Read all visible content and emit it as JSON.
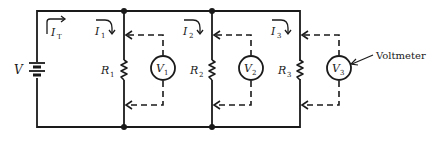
{
  "diagram": {
    "type": "parallel-circuit-with-voltmeters",
    "source": {
      "label": "V"
    },
    "total_current": {
      "label": "I",
      "subscript": "T"
    },
    "branches": [
      {
        "resistor": {
          "label": "R",
          "subscript": "1"
        },
        "current": {
          "label": "I",
          "subscript": "1"
        },
        "voltmeter": {
          "label": "V",
          "subscript": "1"
        }
      },
      {
        "resistor": {
          "label": "R",
          "subscript": "2"
        },
        "current": {
          "label": "I",
          "subscript": "2"
        },
        "voltmeter": {
          "label": "V",
          "subscript": "2"
        }
      },
      {
        "resistor": {
          "label": "R",
          "subscript": "3"
        },
        "current": {
          "label": "I",
          "subscript": "3"
        },
        "voltmeter": {
          "label": "V",
          "subscript": "3"
        }
      }
    ],
    "annotation": {
      "text": "Voltmeter"
    },
    "colors": {
      "ink": "#1a1a1a",
      "background": "#ffffff"
    }
  }
}
